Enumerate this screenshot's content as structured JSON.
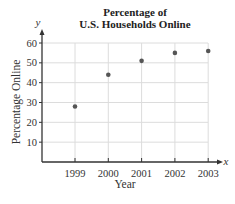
{
  "chart_data": {
    "type": "scatter",
    "title": "Percentage of U.S. Households Online",
    "title_lines": [
      "Percentage of",
      "U.S. Households Online"
    ],
    "xlabel": "Year",
    "ylabel": "Percentage Online",
    "x_var": "x",
    "y_var": "y",
    "categories": [
      "1999",
      "2000",
      "2001",
      "2002",
      "2003"
    ],
    "x": [
      1999,
      2000,
      2001,
      2002,
      2003
    ],
    "values": [
      28,
      44,
      51,
      55,
      56
    ],
    "yticks": [
      10,
      20,
      30,
      40,
      50,
      60
    ],
    "ylim": [
      0,
      60
    ],
    "grid": true,
    "point_color": "#555555"
  }
}
